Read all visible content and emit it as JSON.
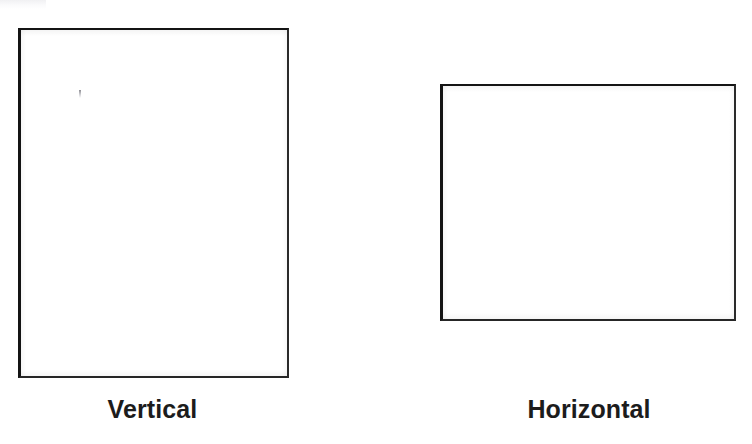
{
  "figure": {
    "background_color": "#ffffff",
    "outline_color": "#1a1a1a",
    "caption_color": "#1c1c1c",
    "artifacts": {
      "corner_smudge": "light-gray-scan-smudge",
      "stray_mark": "faint-pen-tick"
    }
  },
  "shapes": [
    {
      "id": "vertical",
      "icon_name": "portrait-page-outline",
      "orientation": "portrait",
      "caption": "Vertical",
      "x": 18,
      "y": 28,
      "width": 271,
      "height": 350
    },
    {
      "id": "horizontal",
      "icon_name": "landscape-page-outline",
      "orientation": "landscape",
      "caption": "Horizontal",
      "x": 440,
      "y": 84,
      "width": 296,
      "height": 237
    }
  ]
}
